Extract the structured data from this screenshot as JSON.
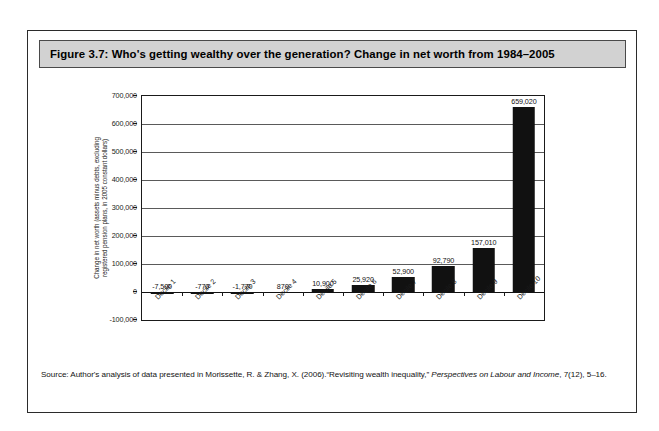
{
  "figure": {
    "title": "Figure 3.7: Who's getting wealthy over the generation? Change in net worth from 1984–2005",
    "source_prefix": "Source: Author's analysis of data presented in Morissette, R. & Zhang, X. (2006).“Revisiting wealth inequality,” ",
    "source_italic_1": "Perspectives on Labour and Income",
    "source_suffix": ", 7(12), 5–16."
  },
  "chart_data": {
    "type": "bar",
    "title": "Figure 3.7: Who's getting wealthy over the generation? Change in net worth from 1984–2005",
    "xlabel": "",
    "ylabel": "Change in net worth (assets minus debts, excluding registered pension plans, in 2005 constant dollars)",
    "ylabel_lines": [
      "Change in net worth (assets minus debts, excluding",
      "registered pension plans, in 2005 constant dollars)"
    ],
    "categories": [
      "Decile 1",
      "Decile 2",
      "Decile 3",
      "Decile 4",
      "Decile 5",
      "Decile 6",
      "Decile 7",
      "Decile 8",
      "Decile 9",
      "Decile 10"
    ],
    "values": [
      -7500,
      -770,
      -1770,
      870,
      10900,
      25920,
      52900,
      92790,
      157010,
      659020
    ],
    "value_labels": [
      "-7,500",
      "-770",
      "-1,770",
      "870",
      "10,900",
      "25,920",
      "52,900",
      "92,790",
      "157,010",
      "659,020"
    ],
    "ylim": [
      -100000,
      700000
    ],
    "ytick_values": [
      -100000,
      0,
      100000,
      200000,
      300000,
      400000,
      500000,
      600000,
      700000
    ],
    "ytick_labels": [
      "-100,000",
      "0",
      "100,000",
      "200,000",
      "300,000",
      "400,000",
      "500,000",
      "600,000",
      "700,000"
    ],
    "grid": true,
    "legend": "none",
    "bar_color": "#111111",
    "series": [
      {
        "name": "Change in net worth 1984–2005",
        "values": [
          -7500,
          -770,
          -1770,
          870,
          10900,
          25920,
          52900,
          92790,
          157010,
          659020
        ]
      }
    ]
  }
}
